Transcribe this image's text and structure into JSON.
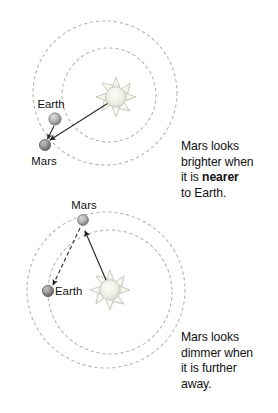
{
  "figure": {
    "panels": [
      {
        "id": "top",
        "bodies": [
          {
            "name": "Sun",
            "label": "",
            "color": "#e8e8e0"
          },
          {
            "name": "Earth",
            "label": "Earth",
            "color": "#b0b0b0"
          },
          {
            "name": "Mars",
            "label": "Mars",
            "color": "#9e9e9e"
          }
        ],
        "orbits": [
          "Earth orbit",
          "Mars orbit"
        ],
        "arrows": [
          {
            "from": "Sun",
            "to": "Mars",
            "style": "solid"
          },
          {
            "from": "Earth",
            "to": "Mars",
            "style": "solid"
          }
        ],
        "caption_line1": "Mars looks",
        "caption_line2": "brighter when",
        "caption_line3_pre": "it is ",
        "caption_line3_bold": "nearer",
        "caption_line4": "to Earth."
      },
      {
        "id": "bottom",
        "bodies": [
          {
            "name": "Sun",
            "label": "",
            "color": "#e8e8e0"
          },
          {
            "name": "Earth",
            "label": "Earth",
            "color": "#8f8f8f"
          },
          {
            "name": "Mars",
            "label": "Mars",
            "color": "#a8a8a8"
          }
        ],
        "orbits": [
          "Earth orbit",
          "Mars orbit"
        ],
        "arrows": [
          {
            "from": "Sun",
            "to": "Mars",
            "style": "solid"
          },
          {
            "from": "Mars",
            "to": "Earth",
            "style": "dashed"
          }
        ],
        "caption_line1": "Mars looks",
        "caption_line2": "dimmer when",
        "caption_line3": "it is further",
        "caption_line4": "away."
      }
    ],
    "labels": {
      "top_earth": "Earth",
      "top_mars": "Mars",
      "bottom_mars": "Mars",
      "bottom_earth": "Earth"
    },
    "colors": {
      "orbit_line": "#b9b0a8",
      "arrow_line": "#2a2a2a",
      "sun_fill": "#efefe6",
      "sun_stroke": "#c9c9c0",
      "text": "#111111",
      "background": "#ffffff"
    }
  }
}
